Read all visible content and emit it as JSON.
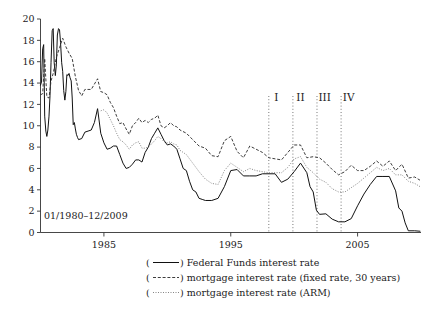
{
  "chart_data": {
    "type": "line",
    "title": "",
    "xlabel": "",
    "ylabel": "",
    "date_range_note": "01/1980–12/2009",
    "xlim": [
      1980,
      2010
    ],
    "ylim": [
      0,
      20
    ],
    "grid": false,
    "xticks": [
      1985,
      1995,
      2005
    ],
    "xtick_labels": [
      "1985",
      "1995",
      "2005"
    ],
    "yticks": [
      0,
      2,
      4,
      6,
      8,
      10,
      12,
      14,
      16,
      18,
      20
    ],
    "ytick_labels": [
      "0",
      "2",
      "4",
      "6",
      "8",
      "10",
      "12",
      "14",
      "16",
      "18",
      "20"
    ],
    "legend_position": "below-axes",
    "annotations": [
      {
        "label": "I",
        "x": 1998.6
      },
      {
        "label": "II",
        "x": 2000.5
      },
      {
        "label": "III",
        "x": 2002.4
      },
      {
        "label": "IV",
        "x": 2004.3
      }
    ],
    "divider_lines": [
      1998.0,
      1999.9,
      1801.8,
      2003.7
    ],
    "series": [
      {
        "name": "Federal Funds interest rate",
        "style": "solid",
        "color": "#111111",
        "x": [
          1980.0,
          1980.08,
          1980.17,
          1980.25,
          1980.33,
          1980.42,
          1980.5,
          1980.58,
          1980.67,
          1980.75,
          1980.83,
          1980.92,
          1981.0,
          1981.08,
          1981.17,
          1981.25,
          1981.33,
          1981.42,
          1981.5,
          1981.58,
          1981.67,
          1981.75,
          1981.83,
          1981.92,
          1982.0,
          1982.08,
          1982.17,
          1982.25,
          1982.33,
          1982.42,
          1982.5,
          1982.58,
          1982.67,
          1982.75,
          1982.83,
          1982.92,
          1983.0,
          1983.25,
          1983.5,
          1983.75,
          1984.0,
          1984.25,
          1984.5,
          1984.75,
          1985.0,
          1985.25,
          1985.5,
          1985.75,
          1986.0,
          1986.25,
          1986.5,
          1986.75,
          1987.0,
          1987.25,
          1987.5,
          1987.75,
          1988.0,
          1988.25,
          1988.5,
          1988.75,
          1989.0,
          1989.25,
          1989.5,
          1989.75,
          1990.0,
          1990.25,
          1990.5,
          1990.75,
          1991.0,
          1991.25,
          1991.5,
          1991.75,
          1992.0,
          1992.25,
          1992.5,
          1992.75,
          1993.0,
          1993.5,
          1994.0,
          1994.5,
          1995.0,
          1995.5,
          1996.0,
          1996.5,
          1997.0,
          1997.5,
          1998.0,
          1998.5,
          1999.0,
          1999.5,
          2000.0,
          2000.5,
          2001.0,
          2001.25,
          2001.5,
          2001.75,
          2002.0,
          2002.5,
          2003.0,
          2003.5,
          2004.0,
          2004.5,
          2005.0,
          2005.5,
          2006.0,
          2006.5,
          2007.0,
          2007.5,
          2008.0,
          2008.25,
          2008.5,
          2008.75,
          2009.0,
          2009.5,
          2009.92
        ],
        "y": [
          13.8,
          14.1,
          17.2,
          17.6,
          10.9,
          9.5,
          9.0,
          9.6,
          10.9,
          12.8,
          15.9,
          18.9,
          19.1,
          15.9,
          14.7,
          15.7,
          18.5,
          19.1,
          19.0,
          17.8,
          15.9,
          15.1,
          13.3,
          12.4,
          13.2,
          14.8,
          14.7,
          14.9,
          14.5,
          14.2,
          12.6,
          10.1,
          10.3,
          9.7,
          9.2,
          8.9,
          8.7,
          8.8,
          9.4,
          9.5,
          9.6,
          10.3,
          11.6,
          9.3,
          8.4,
          7.8,
          7.9,
          8.1,
          8.1,
          7.3,
          6.5,
          6.0,
          6.1,
          6.4,
          6.8,
          6.8,
          6.6,
          7.5,
          8.0,
          8.8,
          9.3,
          9.8,
          9.2,
          8.6,
          8.2,
          8.3,
          8.1,
          7.8,
          6.9,
          6.0,
          5.8,
          4.8,
          4.0,
          3.8,
          3.2,
          3.1,
          3.0,
          3.0,
          3.2,
          4.3,
          5.8,
          5.9,
          5.3,
          5.3,
          5.3,
          5.5,
          5.5,
          5.5,
          4.7,
          5.0,
          5.7,
          6.5,
          5.6,
          4.3,
          3.8,
          2.1,
          1.7,
          1.75,
          1.25,
          1.0,
          1.0,
          1.3,
          2.5,
          3.6,
          4.5,
          5.25,
          5.25,
          5.25,
          3.9,
          2.3,
          2.0,
          0.9,
          0.16,
          0.16,
          0.12
        ]
      },
      {
        "name": "mortgage interest rate (fixed rate, 30 years)",
        "style": "dashed",
        "color": "#333333",
        "x": [
          1980.0,
          1980.17,
          1980.33,
          1980.5,
          1980.67,
          1980.83,
          1981.0,
          1981.25,
          1981.5,
          1981.75,
          1982.0,
          1982.25,
          1982.5,
          1982.75,
          1983.0,
          1983.25,
          1983.5,
          1983.75,
          1984.0,
          1984.25,
          1984.5,
          1984.75,
          1985.0,
          1985.25,
          1985.5,
          1985.75,
          1986.0,
          1986.25,
          1986.5,
          1986.75,
          1987.0,
          1987.25,
          1987.5,
          1987.75,
          1988.0,
          1988.25,
          1988.5,
          1988.75,
          1989.0,
          1989.25,
          1989.5,
          1989.75,
          1990.0,
          1990.25,
          1990.5,
          1990.75,
          1991.0,
          1991.5,
          1992.0,
          1992.5,
          1993.0,
          1993.5,
          1994.0,
          1994.5,
          1995.0,
          1995.5,
          1996.0,
          1996.5,
          1997.0,
          1997.5,
          1998.0,
          1998.5,
          1999.0,
          1999.5,
          2000.0,
          2000.5,
          2001.0,
          2001.5,
          2002.0,
          2002.5,
          2003.0,
          2003.5,
          2004.0,
          2004.5,
          2005.0,
          2005.5,
          2006.0,
          2006.5,
          2007.0,
          2007.5,
          2008.0,
          2008.5,
          2009.0,
          2009.5,
          2009.92
        ],
        "y": [
          12.9,
          13.0,
          16.3,
          12.7,
          12.6,
          14.2,
          14.9,
          16.4,
          17.3,
          18.2,
          17.4,
          16.8,
          16.3,
          14.6,
          13.3,
          12.8,
          13.4,
          13.4,
          13.4,
          13.9,
          14.4,
          13.2,
          13.1,
          12.9,
          12.2,
          11.7,
          10.9,
          10.2,
          10.3,
          9.7,
          9.2,
          10.0,
          10.3,
          10.7,
          10.3,
          10.5,
          10.3,
          10.6,
          10.7,
          11.0,
          10.0,
          9.8,
          10.0,
          10.3,
          10.0,
          9.9,
          9.6,
          9.3,
          8.7,
          8.1,
          7.9,
          7.2,
          7.1,
          8.6,
          9.0,
          7.6,
          7.0,
          8.1,
          7.8,
          7.5,
          7.0,
          6.9,
          6.8,
          7.5,
          8.2,
          8.2,
          7.0,
          7.1,
          7.0,
          6.5,
          5.9,
          5.4,
          5.7,
          6.3,
          5.8,
          5.8,
          6.2,
          6.7,
          6.2,
          6.7,
          5.8,
          6.4,
          5.1,
          5.2,
          4.9
        ]
      },
      {
        "name": "mortgage interest rate (ARM)",
        "style": "dotted",
        "color": "#777777",
        "x": [
          1984.75,
          1985.0,
          1985.25,
          1985.5,
          1985.75,
          1986.0,
          1986.25,
          1986.5,
          1986.75,
          1987.0,
          1987.25,
          1987.5,
          1987.75,
          1988.0,
          1988.25,
          1988.5,
          1988.75,
          1989.0,
          1989.25,
          1989.5,
          1989.75,
          1990.0,
          1990.25,
          1990.5,
          1990.75,
          1991.0,
          1991.5,
          1992.0,
          1992.5,
          1993.0,
          1993.5,
          1994.0,
          1994.5,
          1995.0,
          1995.5,
          1996.0,
          1996.5,
          1997.0,
          1997.5,
          1998.0,
          1998.5,
          1999.0,
          1999.5,
          2000.0,
          2000.5,
          2001.0,
          2001.5,
          2002.0,
          2002.5,
          2003.0,
          2003.5,
          2004.0,
          2004.5,
          2005.0,
          2005.5,
          2006.0,
          2006.5,
          2007.0,
          2007.5,
          2008.0,
          2008.5,
          2009.0,
          2009.5,
          2009.92
        ],
        "y": [
          11.4,
          11.5,
          11.2,
          10.6,
          10.0,
          9.3,
          8.7,
          8.5,
          8.2,
          7.8,
          8.2,
          8.4,
          8.5,
          7.9,
          7.9,
          8.0,
          8.3,
          8.6,
          9.0,
          8.8,
          8.5,
          8.4,
          8.5,
          8.3,
          8.2,
          7.7,
          7.3,
          6.5,
          5.7,
          5.0,
          4.6,
          4.5,
          5.8,
          6.5,
          6.1,
          5.7,
          6.0,
          5.8,
          5.7,
          5.6,
          5.6,
          5.6,
          6.1,
          6.9,
          7.1,
          6.1,
          5.6,
          5.0,
          4.7,
          4.1,
          3.8,
          3.8,
          4.2,
          4.6,
          5.1,
          5.6,
          6.1,
          5.8,
          6.0,
          5.4,
          5.4,
          4.8,
          4.6,
          4.3
        ]
      }
    ]
  },
  "axes": {
    "range_note": "01/1980–12/2009"
  },
  "legend": {
    "items": [
      {
        "marker": "solid-line",
        "label": ") Federal Funds interest rate",
        "open": "("
      },
      {
        "marker": "dashed-line",
        "label": ") mortgage interest rate (fixed rate, 30 years)",
        "open": "("
      },
      {
        "marker": "dotted-line",
        "label": ") mortgage interest rate (ARM)",
        "open": "("
      }
    ]
  }
}
